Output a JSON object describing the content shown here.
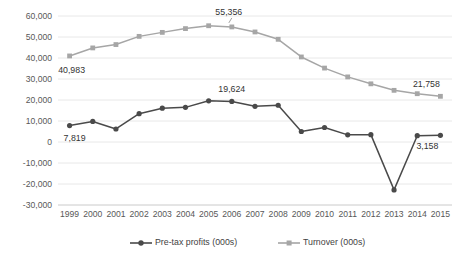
{
  "chart_data": {
    "type": "line",
    "title": "",
    "subtitle": "",
    "xlabel": "",
    "ylabel": "",
    "grid": true,
    "legend_position": "bottom",
    "ylim": [
      -30000,
      60000
    ],
    "ytick_step": 10000,
    "categories": [
      "1999",
      "2000",
      "2001",
      "2002",
      "2003",
      "2004",
      "2005",
      "2006",
      "2007",
      "2008",
      "2009",
      "2010",
      "2011",
      "2012",
      "2013",
      "2014",
      "2015"
    ],
    "ytick_labels": [
      "60,000",
      "50,000",
      "40,000",
      "30,000",
      "20,000",
      "10,000",
      "0",
      "-10,000",
      "-20,000",
      "-30,000"
    ],
    "ytick_values": [
      60000,
      50000,
      40000,
      30000,
      20000,
      10000,
      0,
      -10000,
      -20000,
      -30000
    ],
    "series": [
      {
        "name": "Pre-tax profits (000s)",
        "color": "#4a4a4a",
        "marker": "circle",
        "values": [
          7819,
          9800,
          6200,
          13500,
          16100,
          16500,
          19624,
          19300,
          17000,
          17500,
          5000,
          6900,
          3400,
          3500,
          -22800,
          3000,
          3158
        ]
      },
      {
        "name": "Turnover (000s)",
        "color": "#a6a6a6",
        "marker": "square",
        "values": [
          40983,
          44800,
          46400,
          50300,
          52200,
          54000,
          55356,
          54800,
          52400,
          48900,
          40500,
          35200,
          31000,
          27700,
          24600,
          23000,
          21758
        ]
      }
    ],
    "annotations": [
      {
        "text": "40,983",
        "series": "Turnover (000s)",
        "category": "1999"
      },
      {
        "text": "55,356",
        "series": "Turnover (000s)",
        "category": "2006"
      },
      {
        "text": "21,758",
        "series": "Turnover (000s)",
        "category": "2015"
      },
      {
        "text": "7,819",
        "series": "Pre-tax profits (000s)",
        "category": "1999"
      },
      {
        "text": "19,624",
        "series": "Pre-tax profits (000s)",
        "category": "2006"
      },
      {
        "text": "3,158",
        "series": "Pre-tax profits (000s)",
        "category": "2015"
      }
    ]
  },
  "legend": {
    "items": [
      {
        "label": "Pre-tax profits (000s)",
        "color": "#4a4a4a",
        "marker": "circle"
      },
      {
        "label": "Turnover (000s)",
        "color": "#a6a6a6",
        "marker": "square"
      }
    ]
  }
}
